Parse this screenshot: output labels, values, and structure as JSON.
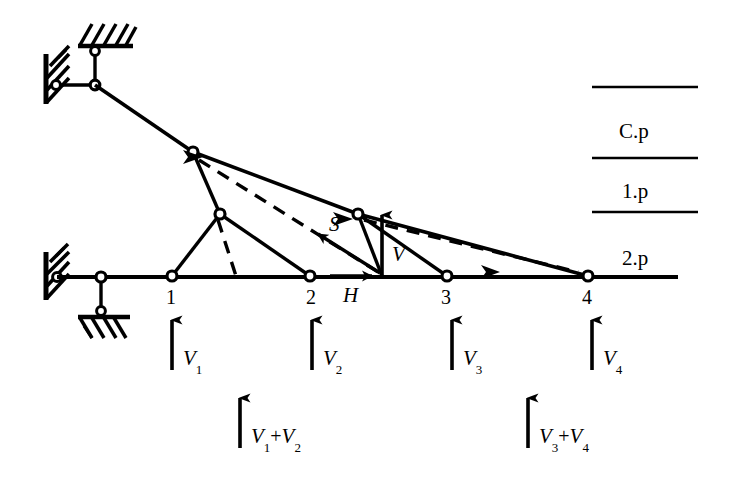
{
  "figure": {
    "type": "structural-truss-diagram",
    "stroke_color": "#000000",
    "background_color": "#ffffff"
  },
  "nodes": [
    {
      "id": "n1",
      "label": "1"
    },
    {
      "id": "n2",
      "label": "2"
    },
    {
      "id": "n3",
      "label": "3"
    },
    {
      "id": "n4",
      "label": "4"
    }
  ],
  "section_forces": {
    "diagonal": "S",
    "vertical": "V",
    "horizontal": "H"
  },
  "reactions": {
    "v1": "V",
    "v1_sub": "1",
    "v2": "V",
    "v2_sub": "2",
    "v3": "V",
    "v3_sub": "3",
    "v4": "V",
    "v4_sub": "4",
    "sum_left_a": "V",
    "sum_left_a_sub": "1",
    "sum_left_op": "+",
    "sum_left_b": "V",
    "sum_left_b_sub": "2",
    "sum_right_a": "V",
    "sum_right_a_sub": "3",
    "sum_right_op": "+",
    "sum_right_b": "V",
    "sum_right_b_sub": "4"
  },
  "reference_planes": [
    {
      "label": "C.p"
    },
    {
      "label": "1.p"
    },
    {
      "label": "2.p"
    }
  ]
}
